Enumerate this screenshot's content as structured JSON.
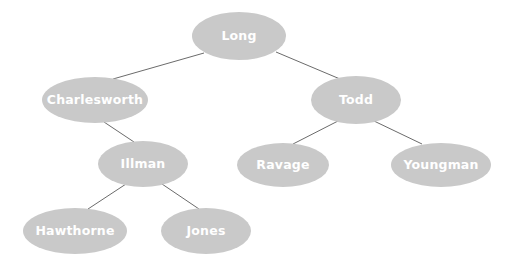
{
  "diagram": {
    "type": "tree",
    "title": "",
    "node_fill_color": "#c9c9c9",
    "node_text_color": "#ffffff",
    "edge_color": "#6b6b6b",
    "background_color": "#ffffff",
    "nodes": [
      {
        "id": "long",
        "label": "Long",
        "cx": 239,
        "cy": 36,
        "rx": 47,
        "ry": 24
      },
      {
        "id": "charlesworth",
        "label": "Charlesworth",
        "cx": 95,
        "cy": 100,
        "rx": 53,
        "ry": 23
      },
      {
        "id": "todd",
        "label": "Todd",
        "cx": 356,
        "cy": 100,
        "rx": 45,
        "ry": 24
      },
      {
        "id": "illman",
        "label": "Illman",
        "cx": 143,
        "cy": 164,
        "rx": 45,
        "ry": 23
      },
      {
        "id": "ravage",
        "label": "Ravage",
        "cx": 283,
        "cy": 165,
        "rx": 46,
        "ry": 22
      },
      {
        "id": "youngman",
        "label": "Youngman",
        "cx": 441,
        "cy": 165,
        "rx": 50,
        "ry": 22
      },
      {
        "id": "hawthorne",
        "label": "Hawthorne",
        "cx": 75,
        "cy": 231,
        "rx": 52,
        "ry": 23
      },
      {
        "id": "jones",
        "label": "Jones",
        "cx": 206,
        "cy": 231,
        "rx": 45,
        "ry": 23
      }
    ],
    "edges": [
      {
        "from": "long",
        "to": "charlesworth",
        "x1": 204,
        "y1": 53,
        "x2": 113,
        "y2": 79
      },
      {
        "from": "long",
        "to": "todd",
        "x1": 276,
        "y1": 52,
        "x2": 340,
        "y2": 79
      },
      {
        "from": "charlesworth",
        "to": "illman",
        "x1": 104,
        "y1": 122,
        "x2": 134,
        "y2": 142
      },
      {
        "from": "illman",
        "to": "hawthorne",
        "x1": 126,
        "y1": 184,
        "x2": 88,
        "y2": 209
      },
      {
        "from": "illman",
        "to": "jones",
        "x1": 162,
        "y1": 184,
        "x2": 199,
        "y2": 209
      },
      {
        "from": "todd",
        "to": "ravage",
        "x1": 338,
        "y1": 121,
        "x2": 293,
        "y2": 144
      },
      {
        "from": "todd",
        "to": "youngman",
        "x1": 374,
        "y1": 121,
        "x2": 422,
        "y2": 144
      }
    ]
  }
}
